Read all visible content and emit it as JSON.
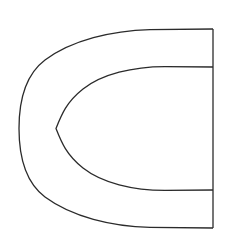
{
  "figure": {
    "title": "C-shaped open annulus outline",
    "canvas": {
      "width": 230,
      "height": 249,
      "background_color": "#ffffff"
    },
    "style": {
      "stroke_color": "#2b2b2b",
      "stroke_width": 1.3,
      "fill": "none"
    },
    "geometry": {
      "vertical_axis_x": 213,
      "center_y": 128.5,
      "outer": {
        "name": "outer-band-curve",
        "leftmost_x": 19,
        "top_corner": [
          213,
          29
        ],
        "bottom_corner": [
          213,
          228
        ],
        "top_y_at_corner": 29,
        "bottom_y_at_corner": 228
      },
      "inner": {
        "name": "inner-band-curve",
        "leftmost_x": 56,
        "top_junction": [
          213,
          67
        ],
        "bottom_junction": [
          213,
          190
        ],
        "top_y_at_junction": 67,
        "bottom_y_at_junction": 190
      },
      "right_edge": {
        "name": "right-vertical-edge",
        "x": 213,
        "y_start": 29,
        "y_end": 228
      }
    },
    "paths": {
      "outer": "M 213 29 L 150 29.6 C 112 30.6 72 40 45 60 C 24.5 75.5 19 101 19 128.5 C 19 156 24.5 181.5 45 197 C 72 217 112 226.4 150 227.4 L 213 228",
      "inner": "M 213 67 L 165 66.6 C 133 66.6 102 74 83 89 C 66.5 102 61.5 114.5 56 128.5 C 61.5 142.5 66.5 155 83 168 C 102 183 133 190.4 165 190.4 L 213 190",
      "right_edge": "M 213 29 L 213 228"
    }
  }
}
